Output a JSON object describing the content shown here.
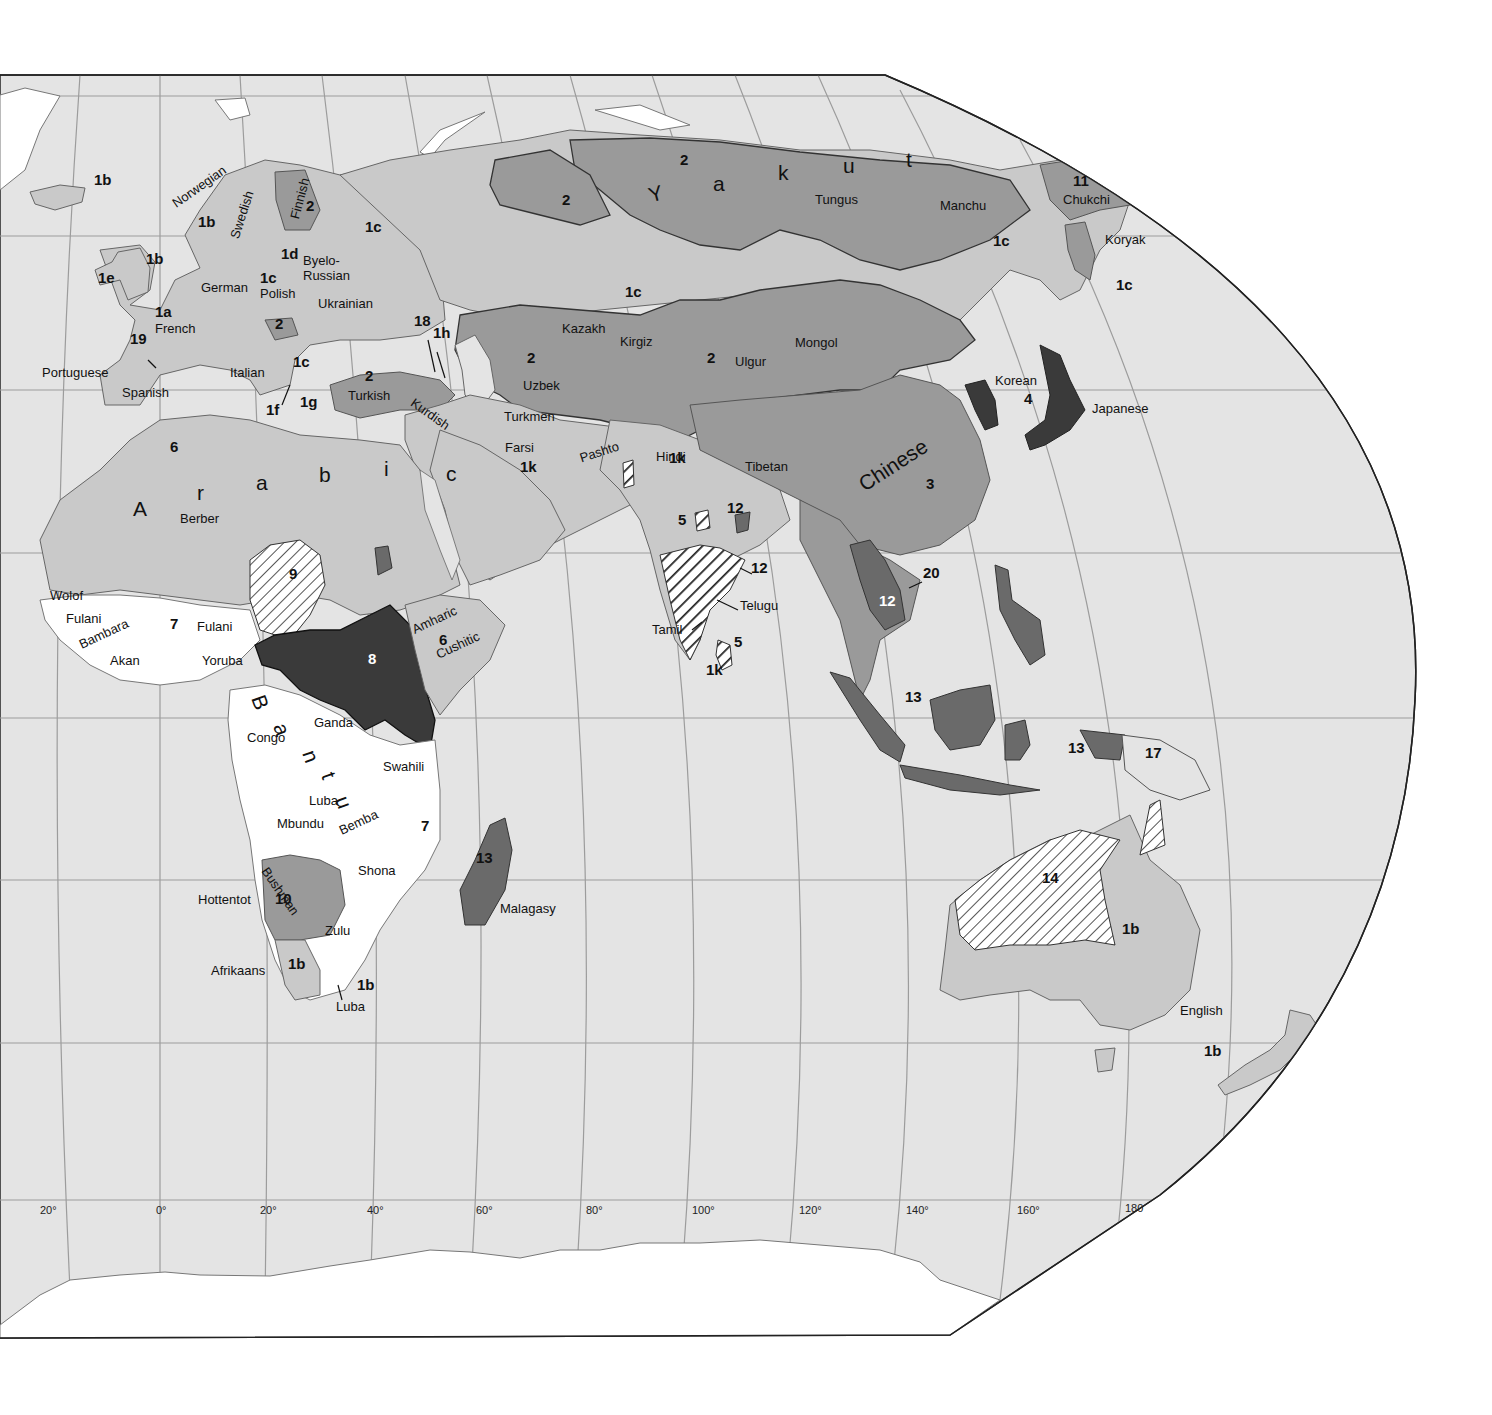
{
  "map": {
    "type": "language families map (Eastern Hemisphere)",
    "colors": {
      "ocean": "#e4e4e4",
      "ice": "#ffffff",
      "tone_light": "#c9c9c9",
      "tone_medium": "#9a9a9a",
      "tone_dark": "#6a6a6a",
      "tone_darkest": "#3a3a3a",
      "grid": "#9c9c9c",
      "border": "#333333"
    },
    "longitude_labels": [
      {
        "text": "20°",
        "x": 40,
        "y": 1216
      },
      {
        "text": "0°",
        "x": 156,
        "y": 1216
      },
      {
        "text": "20°",
        "x": 260,
        "y": 1216
      },
      {
        "text": "40°",
        "x": 367,
        "y": 1216
      },
      {
        "text": "60°",
        "x": 476,
        "y": 1216
      },
      {
        "text": "80°",
        "x": 586,
        "y": 1216
      },
      {
        "text": "100°",
        "x": 692,
        "y": 1216
      },
      {
        "text": "120°",
        "x": 799,
        "y": 1216
      },
      {
        "text": "140°",
        "x": 906,
        "y": 1216
      },
      {
        "text": "160°",
        "x": 1017,
        "y": 1216
      },
      {
        "text": "180",
        "x": 1125,
        "y": 1214
      }
    ],
    "language_labels": [
      {
        "text": "Norwegian",
        "x": 170,
        "y": 210,
        "rot": -35
      },
      {
        "text": "Swedish",
        "x": 228,
        "y": 247,
        "rot": -72
      },
      {
        "text": "Finnish",
        "x": 288,
        "y": 228,
        "rot": -75
      },
      {
        "text": "Byelo-",
        "x": 303,
        "y": 265
      },
      {
        "text": "Russian",
        "x": 303,
        "y": 280
      },
      {
        "text": "German",
        "x": 201,
        "y": 292
      },
      {
        "text": "Polish",
        "x": 260,
        "y": 298
      },
      {
        "text": "Ukrainian",
        "x": 318,
        "y": 308
      },
      {
        "text": "French",
        "x": 155,
        "y": 333
      },
      {
        "text": "Portuguese",
        "x": 42,
        "y": 377
      },
      {
        "text": "Italian",
        "x": 230,
        "y": 377
      },
      {
        "text": "Spanish",
        "x": 122,
        "y": 397
      },
      {
        "text": "Turkish",
        "x": 348,
        "y": 400
      },
      {
        "text": "Kurdish",
        "x": 416,
        "y": 407,
        "rot": 35
      },
      {
        "text": "Kazakh",
        "x": 562,
        "y": 333
      },
      {
        "text": "Uzbek",
        "x": 523,
        "y": 390
      },
      {
        "text": "Kirgiz",
        "x": 620,
        "y": 346
      },
      {
        "text": "Turkmen",
        "x": 504,
        "y": 421
      },
      {
        "text": "Farsi",
        "x": 505,
        "y": 452
      },
      {
        "text": "Pashto",
        "x": 578,
        "y": 463,
        "rot": -18
      },
      {
        "text": "Hindi",
        "x": 656,
        "y": 461
      },
      {
        "text": "Tibetan",
        "x": 745,
        "y": 471
      },
      {
        "text": "Mongol",
        "x": 795,
        "y": 347
      },
      {
        "text": "Ulgur",
        "x": 735,
        "y": 366
      },
      {
        "text": "Tungus",
        "x": 815,
        "y": 204
      },
      {
        "text": "Manchu",
        "x": 940,
        "y": 210
      },
      {
        "text": "Chukchi",
        "x": 1063,
        "y": 204
      },
      {
        "text": "Koryak",
        "x": 1105,
        "y": 244
      },
      {
        "text": "Korean",
        "x": 995,
        "y": 385
      },
      {
        "text": "Japanese",
        "x": 1092,
        "y": 413
      },
      {
        "text": "Berber",
        "x": 180,
        "y": 523
      },
      {
        "text": "Wolof",
        "x": 50,
        "y": 600
      },
      {
        "text": "Fulani",
        "x": 66,
        "y": 623
      },
      {
        "text": "Bambara",
        "x": 77,
        "y": 650,
        "rot": -25
      },
      {
        "text": "Fulani",
        "x": 197,
        "y": 631
      },
      {
        "text": "Akan",
        "x": 110,
        "y": 665
      },
      {
        "text": "Yoruba",
        "x": 202,
        "y": 665
      },
      {
        "text": "Amharic",
        "x": 410,
        "y": 635,
        "rot": -25
      },
      {
        "text": "Cushitic",
        "x": 434,
        "y": 660,
        "rot": -25
      },
      {
        "text": "Telugu",
        "x": 740,
        "y": 610
      },
      {
        "text": "Tamil",
        "x": 652,
        "y": 634
      },
      {
        "text": "Ganda",
        "x": 314,
        "y": 727
      },
      {
        "text": "Congo",
        "x": 247,
        "y": 742
      },
      {
        "text": "Swahili",
        "x": 383,
        "y": 771
      },
      {
        "text": "Luba",
        "x": 309,
        "y": 805
      },
      {
        "text": "Mbundu",
        "x": 277,
        "y": 828
      },
      {
        "text": "Bemba",
        "x": 337,
        "y": 836,
        "rot": -25
      },
      {
        "text": "Shona",
        "x": 358,
        "y": 875
      },
      {
        "text": "Hottentot",
        "x": 198,
        "y": 904
      },
      {
        "text": "Bushman",
        "x": 270,
        "y": 876,
        "rot": 55
      },
      {
        "text": "Zulu",
        "x": 325,
        "y": 935
      },
      {
        "text": "Afrikaans",
        "x": 211,
        "y": 975
      },
      {
        "text": "Luba",
        "x": 336,
        "y": 1011
      },
      {
        "text": "Malagasy",
        "x": 500,
        "y": 913
      },
      {
        "text": "English",
        "x": 1180,
        "y": 1015
      }
    ],
    "code_labels": [
      {
        "text": "1b",
        "x": 94,
        "y": 183
      },
      {
        "text": "2",
        "x": 306,
        "y": 209
      },
      {
        "text": "1c",
        "x": 365,
        "y": 230
      },
      {
        "text": "1b",
        "x": 198,
        "y": 225
      },
      {
        "text": "1d",
        "x": 281,
        "y": 257
      },
      {
        "text": "1b",
        "x": 146,
        "y": 262
      },
      {
        "text": "1e",
        "x": 98,
        "y": 281
      },
      {
        "text": "1c",
        "x": 260,
        "y": 281
      },
      {
        "text": "1a",
        "x": 155,
        "y": 315
      },
      {
        "text": "2",
        "x": 275,
        "y": 327
      },
      {
        "text": "19",
        "x": 130,
        "y": 342
      },
      {
        "text": "1c",
        "x": 293,
        "y": 365
      },
      {
        "text": "1f",
        "x": 266,
        "y": 413
      },
      {
        "text": "1g",
        "x": 300,
        "y": 405
      },
      {
        "text": "2",
        "x": 365,
        "y": 379
      },
      {
        "text": "18",
        "x": 414,
        "y": 324
      },
      {
        "text": "1h",
        "x": 433,
        "y": 336
      },
      {
        "text": "2",
        "x": 562,
        "y": 203
      },
      {
        "text": "2",
        "x": 680,
        "y": 163
      },
      {
        "text": "1c",
        "x": 625,
        "y": 295
      },
      {
        "text": "2",
        "x": 527,
        "y": 361
      },
      {
        "text": "2",
        "x": 707,
        "y": 361
      },
      {
        "text": "11",
        "x": 1073,
        "y": 184
      },
      {
        "text": "1c",
        "x": 993,
        "y": 244
      },
      {
        "text": "1c",
        "x": 1116,
        "y": 288
      },
      {
        "text": "4",
        "x": 1024,
        "y": 402
      },
      {
        "text": "3",
        "x": 926,
        "y": 487
      },
      {
        "text": "1k",
        "x": 520,
        "y": 470
      },
      {
        "text": "1k",
        "x": 669,
        "y": 461
      },
      {
        "text": "5",
        "x": 678,
        "y": 523
      },
      {
        "text": "12",
        "x": 727,
        "y": 511
      },
      {
        "text": "12",
        "x": 751,
        "y": 571
      },
      {
        "text": "20",
        "x": 923,
        "y": 576
      },
      {
        "text": "12",
        "x": 879,
        "y": 604,
        "white": true
      },
      {
        "text": "5",
        "x": 734,
        "y": 645
      },
      {
        "text": "1k",
        "x": 706,
        "y": 673
      },
      {
        "text": "6",
        "x": 170,
        "y": 450
      },
      {
        "text": "9",
        "x": 289,
        "y": 577
      },
      {
        "text": "7",
        "x": 170,
        "y": 627
      },
      {
        "text": "8",
        "x": 368,
        "y": 662,
        "white": true
      },
      {
        "text": "6",
        "x": 439,
        "y": 643
      },
      {
        "text": "7",
        "x": 421,
        "y": 829
      },
      {
        "text": "13",
        "x": 476,
        "y": 861
      },
      {
        "text": "10",
        "x": 275,
        "y": 902
      },
      {
        "text": "1b",
        "x": 288,
        "y": 967
      },
      {
        "text": "1b",
        "x": 357,
        "y": 988
      },
      {
        "text": "13",
        "x": 905,
        "y": 700
      },
      {
        "text": "13",
        "x": 1068,
        "y": 751
      },
      {
        "text": "17",
        "x": 1145,
        "y": 756
      },
      {
        "text": "14",
        "x": 1042,
        "y": 881
      },
      {
        "text": "1b",
        "x": 1122,
        "y": 932
      },
      {
        "text": "1b",
        "x": 1204,
        "y": 1054
      }
    ],
    "large_spaced_labels": [
      {
        "text": "Y",
        "x": 646,
        "y": 203,
        "rot": -15
      },
      {
        "text": "a",
        "x": 713,
        "y": 191
      },
      {
        "text": "k",
        "x": 778,
        "y": 180
      },
      {
        "text": "u",
        "x": 843,
        "y": 173
      },
      {
        "text": "t",
        "x": 906,
        "y": 167
      },
      {
        "text": "Chinese",
        "x": 855,
        "y": 495,
        "rot": -33
      },
      {
        "text": "A",
        "x": 133,
        "y": 516
      },
      {
        "text": "r",
        "x": 197,
        "y": 500
      },
      {
        "text": "a",
        "x": 256,
        "y": 490
      },
      {
        "text": "b",
        "x": 319,
        "y": 482
      },
      {
        "text": "i",
        "x": 384,
        "y": 476
      },
      {
        "text": "c",
        "x": 446,
        "y": 481
      },
      {
        "text": "B",
        "x": 268,
        "y": 710,
        "rot": 70
      },
      {
        "text": "a",
        "x": 290,
        "y": 738,
        "rot": 70
      },
      {
        "text": "n",
        "x": 319,
        "y": 765,
        "rot": 70
      },
      {
        "text": "t",
        "x": 338,
        "y": 787,
        "rot": 70
      },
      {
        "text": "u",
        "x": 352,
        "y": 811,
        "rot": 70
      }
    ]
  }
}
